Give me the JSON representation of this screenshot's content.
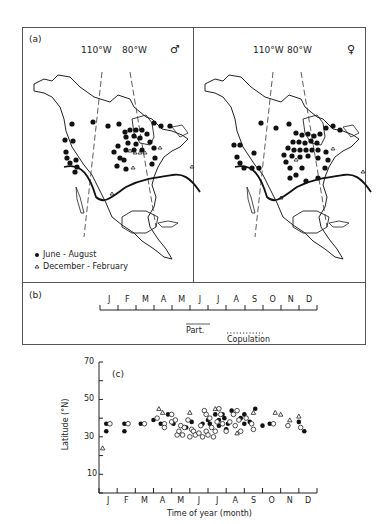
{
  "panel_a": {
    "label": "(a)",
    "meridian_west_1": "110°W",
    "meridian_west_2": "80°W",
    "male_symbol": "♂",
    "female_symbol": "♀",
    "legend": {
      "filled": "June - August",
      "open_triangle": "December - February"
    }
  },
  "panel_b": {
    "label": "(b)",
    "months": [
      "J",
      "F",
      "M",
      "A",
      "M",
      "J",
      "J",
      "A",
      "S",
      "O",
      "N",
      "D"
    ],
    "parturition_label": "Part.",
    "copulation_label": "Copulation"
  },
  "chart_data": {
    "type": "scatter",
    "title": "(c)",
    "xlabel": "Time of year (month)",
    "ylabel": "Latitude (°N)",
    "x_tick_labels": [
      "J",
      "F",
      "M",
      "A",
      "M",
      "J",
      "J",
      "A",
      "S",
      "O",
      "N",
      "D"
    ],
    "y_ticks": [
      10,
      30,
      50,
      70
    ],
    "ylim": [
      0,
      70
    ],
    "xlim": [
      0,
      12
    ],
    "grid": false,
    "legend": "none (symbols as in panel a: filled circle, open circle, open triangle)",
    "series": [
      {
        "name": "filled circles",
        "marker": "filled-circle",
        "points": [
          [
            0.4,
            37
          ],
          [
            0.4,
            33
          ],
          [
            1.4,
            37
          ],
          [
            1.4,
            33
          ],
          [
            2.3,
            37
          ],
          [
            3.0,
            39
          ],
          [
            3.4,
            37
          ],
          [
            3.8,
            42
          ],
          [
            4.1,
            37
          ],
          [
            4.8,
            35
          ],
          [
            5.1,
            38
          ],
          [
            5.7,
            37
          ],
          [
            6.0,
            39
          ],
          [
            6.1,
            37
          ],
          [
            6.4,
            42
          ],
          [
            6.6,
            39
          ],
          [
            6.6,
            36
          ],
          [
            6.8,
            42
          ],
          [
            6.9,
            40
          ],
          [
            7.0,
            34
          ],
          [
            7.1,
            37
          ],
          [
            7.3,
            44
          ],
          [
            7.8,
            40
          ],
          [
            8.0,
            42
          ],
          [
            8.0,
            37
          ],
          [
            8.3,
            38
          ],
          [
            8.6,
            45
          ],
          [
            9.0,
            36
          ],
          [
            9.4,
            37
          ],
          [
            11.0,
            38
          ],
          [
            11.3,
            33
          ]
        ]
      },
      {
        "name": "open circles",
        "marker": "open-circle",
        "points": [
          [
            0.6,
            37
          ],
          [
            1.6,
            37
          ],
          [
            2.5,
            37
          ],
          [
            3.2,
            40
          ],
          [
            3.6,
            37
          ],
          [
            3.6,
            35
          ],
          [
            4.0,
            42
          ],
          [
            4.0,
            38
          ],
          [
            4.2,
            39
          ],
          [
            4.3,
            31
          ],
          [
            4.4,
            33
          ],
          [
            4.5,
            36
          ],
          [
            4.6,
            31
          ],
          [
            4.7,
            35
          ],
          [
            4.9,
            39
          ],
          [
            5.0,
            30
          ],
          [
            5.1,
            34
          ],
          [
            5.2,
            33
          ],
          [
            5.3,
            31
          ],
          [
            5.5,
            32
          ],
          [
            5.6,
            36
          ],
          [
            5.7,
            30
          ],
          [
            5.8,
            44
          ],
          [
            5.9,
            42
          ],
          [
            5.9,
            33
          ],
          [
            6.0,
            31
          ],
          [
            6.1,
            40
          ],
          [
            6.2,
            35
          ],
          [
            6.3,
            30
          ],
          [
            6.4,
            33
          ],
          [
            6.5,
            38
          ],
          [
            6.6,
            45
          ],
          [
            6.7,
            42
          ],
          [
            6.8,
            37
          ],
          [
            7.0,
            33
          ],
          [
            7.2,
            38
          ],
          [
            7.4,
            42
          ],
          [
            7.5,
            36
          ],
          [
            7.6,
            44
          ],
          [
            7.7,
            39
          ],
          [
            7.8,
            33
          ],
          [
            8.1,
            40
          ],
          [
            8.4,
            37
          ],
          [
            8.5,
            34
          ],
          [
            9.6,
            37
          ],
          [
            10.4,
            36
          ],
          [
            11.1,
            35
          ]
        ]
      },
      {
        "name": "open triangles",
        "marker": "open-triangle",
        "points": [
          [
            0.2,
            24
          ],
          [
            3.3,
            45
          ],
          [
            3.5,
            43
          ],
          [
            5.0,
            43
          ],
          [
            6.4,
            45
          ],
          [
            7.6,
            32
          ],
          [
            8.5,
            43
          ],
          [
            9.7,
            43
          ],
          [
            10.0,
            42
          ],
          [
            10.5,
            39
          ],
          [
            11.0,
            41
          ]
        ]
      }
    ]
  }
}
